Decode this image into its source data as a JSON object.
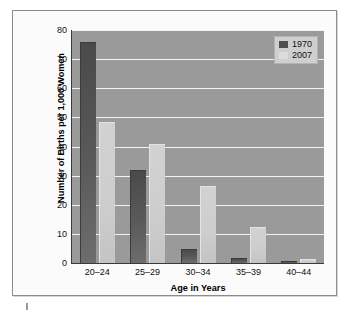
{
  "chart_data": {
    "type": "bar",
    "title": "",
    "xlabel": "Age in Years",
    "ylabel": "Number of Births per 1,000 Women",
    "categories": [
      "20–24",
      "25–29",
      "30–34",
      "35–39",
      "40–44"
    ],
    "series": [
      {
        "name": "1970",
        "values": [
          75.5,
          31.5,
          4.5,
          1.5,
          0.5
        ],
        "color": "#545454"
      },
      {
        "name": "2007",
        "values": [
          48,
          40.5,
          26,
          12,
          1
        ],
        "color": "#cdcdcd"
      }
    ],
    "ylim": [
      0,
      80
    ],
    "ytick_values": [
      80,
      70,
      60,
      50,
      40,
      30,
      20,
      10,
      0
    ],
    "ytick_labels": [
      "80",
      "70",
      "60",
      "50",
      "40",
      "30",
      "20",
      "10",
      "0"
    ],
    "grid": true,
    "grid_color": "#f2f2f2",
    "legend_position": "top-right",
    "legend_entries": [
      "1970",
      "2007"
    ],
    "plot_background": "#9a9a9a",
    "figure_background": "#fbfbfb",
    "axis_color": "#3a3a3a"
  }
}
